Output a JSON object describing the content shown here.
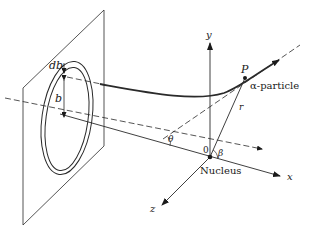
{
  "diagram": {
    "labels": {
      "db": "db",
      "b": "b",
      "y_axis": "y",
      "x_axis": "x",
      "z_axis": "z",
      "point_p": "P",
      "alpha_particle": "α-particle",
      "r": "r",
      "theta": "θ",
      "beta": "β",
      "origin": "0",
      "nucleus": "Nucleus"
    },
    "colors": {
      "ink": "#2a2a2a",
      "background": "#ffffff"
    }
  }
}
